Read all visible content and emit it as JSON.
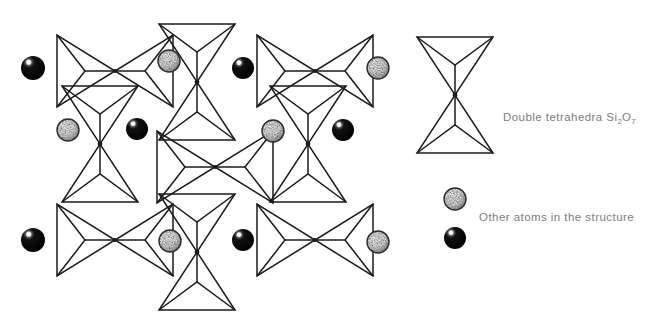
{
  "figure": {
    "background_color": "#ffffff",
    "line_color": "#1a1a1a",
    "text_color": "#7c7c7c"
  },
  "legend": {
    "items": [
      {
        "id": "double-tetrahedra",
        "symbol": "vertical-double-tetrahedron",
        "label_prefix": "Double tetrahedra Si",
        "label_sub1": "2",
        "label_mid": "O",
        "label_sub2": "7",
        "label_full": "Double tetrahedra Si2O7"
      },
      {
        "id": "other-atoms",
        "symbol": "stippled-sphere-and-black-sphere",
        "label": "Other atoms in the structure"
      }
    ]
  },
  "structure": {
    "description": "3x3 lattice of double tetrahedra alternating orientation, interspersed with atom spheres",
    "tetrahedra": [
      {
        "id": "t-r1-c1",
        "orientation": "horizontal",
        "cx": 115,
        "cy": 71
      },
      {
        "id": "t-r1-c2",
        "orientation": "vertical",
        "cx": 197,
        "cy": 82
      },
      {
        "id": "t-r1-c3",
        "orientation": "horizontal",
        "cx": 315,
        "cy": 71
      },
      {
        "id": "t-r2-c1",
        "orientation": "vertical",
        "cx": 100,
        "cy": 144
      },
      {
        "id": "t-r2-c2",
        "orientation": "horizontal",
        "cx": 215,
        "cy": 167
      },
      {
        "id": "t-r2-c3",
        "orientation": "vertical",
        "cx": 308,
        "cy": 144
      },
      {
        "id": "t-r3-c1",
        "orientation": "horizontal",
        "cx": 115,
        "cy": 240
      },
      {
        "id": "t-r3-c2",
        "orientation": "vertical",
        "cx": 197,
        "cy": 252
      },
      {
        "id": "t-r3-c3",
        "orientation": "horizontal",
        "cx": 315,
        "cy": 240
      }
    ],
    "atoms": [
      {
        "id": "a-1",
        "type": "black",
        "cx": 33,
        "cy": 68,
        "r": 12
      },
      {
        "id": "a-2",
        "type": "stippled",
        "cx": 169,
        "cy": 61,
        "r": 11
      },
      {
        "id": "a-3",
        "type": "black",
        "cx": 243,
        "cy": 68,
        "r": 11
      },
      {
        "id": "a-4",
        "type": "stippled",
        "cx": 378,
        "cy": 68,
        "r": 11
      },
      {
        "id": "a-5",
        "type": "stippled",
        "cx": 68,
        "cy": 130,
        "r": 11
      },
      {
        "id": "a-6",
        "type": "black",
        "cx": 137,
        "cy": 129,
        "r": 11
      },
      {
        "id": "a-7",
        "type": "stippled",
        "cx": 273,
        "cy": 131,
        "r": 11
      },
      {
        "id": "a-8",
        "type": "black",
        "cx": 343,
        "cy": 130,
        "r": 11
      },
      {
        "id": "a-9",
        "type": "black",
        "cx": 33,
        "cy": 240,
        "r": 12
      },
      {
        "id": "a-10",
        "type": "stippled",
        "cx": 170,
        "cy": 241,
        "r": 11
      },
      {
        "id": "a-11",
        "type": "black",
        "cx": 243,
        "cy": 240,
        "r": 11
      },
      {
        "id": "a-12",
        "type": "stippled",
        "cx": 378,
        "cy": 242,
        "r": 11
      }
    ]
  },
  "legend_marks": {
    "tetrahedron": {
      "cx": 455,
      "cy": 95,
      "orientation": "vertical"
    },
    "stippled_sphere": {
      "cx": 455,
      "cy": 199,
      "r": 11
    },
    "black_sphere": {
      "cx": 455,
      "cy": 238,
      "r": 11
    }
  }
}
